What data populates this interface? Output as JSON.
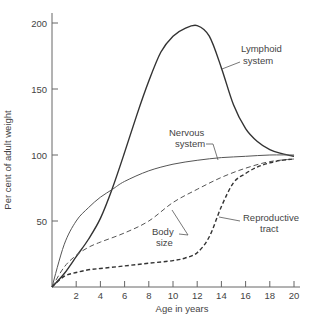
{
  "chart_data": {
    "type": "line",
    "title": "",
    "xlabel": "Age in years",
    "ylabel": "Per cent of adult weight",
    "xlim": [
      0,
      20
    ],
    "ylim": [
      0,
      210
    ],
    "x_ticks": [
      2,
      4,
      6,
      8,
      10,
      12,
      14,
      16,
      18,
      20
    ],
    "y_ticks": [
      50,
      100,
      150,
      200
    ],
    "grid": false,
    "legend": "inline annotations",
    "series": [
      {
        "name": "Lymphoid system",
        "label_lines": [
          "Lymphoid",
          "system"
        ],
        "style": "solid-heavy",
        "x": [
          0,
          1,
          2,
          3,
          4,
          5,
          6,
          7,
          8,
          9,
          10,
          11,
          12,
          13,
          14,
          15,
          16,
          17,
          18,
          19,
          20
        ],
        "y": [
          0,
          10,
          23,
          36,
          52,
          75,
          102,
          130,
          156,
          178,
          190,
          196,
          198,
          190,
          166,
          138,
          120,
          110,
          104,
          101,
          99
        ]
      },
      {
        "name": "Nervous system",
        "label_lines": [
          "Nervous",
          "system"
        ],
        "style": "solid-light",
        "x": [
          0,
          1,
          2,
          3,
          4,
          5,
          6,
          8,
          10,
          12,
          14,
          16,
          18,
          20
        ],
        "y": [
          0,
          32,
          50,
          60,
          68,
          74,
          80,
          88,
          93,
          96,
          98,
          99,
          100,
          100
        ]
      },
      {
        "name": "Body size",
        "label_lines": [
          "Body",
          "size"
        ],
        "style": "dashed",
        "x": [
          0,
          1,
          2,
          3,
          4,
          6,
          8,
          10,
          12,
          14,
          16,
          18,
          20
        ],
        "y": [
          0,
          15,
          24,
          30,
          34,
          41,
          50,
          64,
          74,
          83,
          90,
          95,
          97
        ]
      },
      {
        "name": "Reproductive tract",
        "label_lines": [
          "Reproductive",
          "tract"
        ],
        "style": "dashed-heavy",
        "x": [
          0,
          1,
          2,
          3,
          4,
          6,
          8,
          10,
          11,
          12,
          13,
          14,
          15,
          16,
          17,
          18,
          19,
          20
        ],
        "y": [
          0,
          8,
          11,
          13,
          14,
          16,
          18,
          20,
          22,
          26,
          38,
          61,
          79,
          86,
          91,
          94,
          96,
          97
        ]
      }
    ]
  },
  "axes": {
    "xlabel": "Age in years",
    "ylabel": "Per cent of adult weight"
  },
  "annotations": {
    "lymphoid": [
      "Lymphoid",
      "system"
    ],
    "nervous": [
      "Nervous",
      "system"
    ],
    "body": [
      "Body",
      "size"
    ],
    "reproductive": [
      "Reproductive",
      "tract"
    ]
  }
}
